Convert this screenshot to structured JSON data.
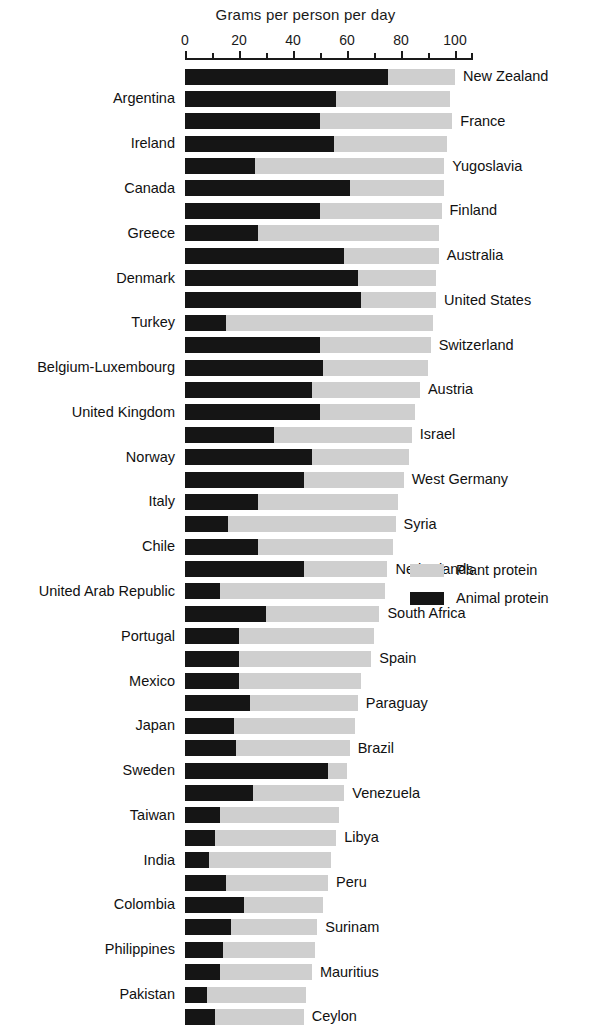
{
  "chart_data": {
    "type": "bar",
    "orientation": "horizontal",
    "stacked": true,
    "title": "Grams per person per day",
    "xlabel": "Grams per person per day",
    "ylabel": "",
    "xlim": [
      0,
      107
    ],
    "grid": false,
    "legend_position": "bottom-right",
    "tick_labels": [
      "0",
      "20",
      "40",
      "60",
      "80",
      "100"
    ],
    "tick_values": [
      0,
      20,
      40,
      60,
      80,
      100
    ],
    "minor_tick_values": [
      10,
      30,
      50,
      70,
      90
    ],
    "series": [
      {
        "name": "Animal protein",
        "color": "#151515"
      },
      {
        "name": "Plant protein",
        "color": "#cfcfcf"
      }
    ],
    "categories": [
      "New Zealand",
      "Argentina",
      "France",
      "Ireland",
      "Yugoslavia",
      "Canada",
      "Finland",
      "Greece",
      "Australia",
      "Denmark",
      "United States",
      "Turkey",
      "Switzerland",
      "Belgium-Luxembourg",
      "Austria",
      "United Kingdom",
      "Israel",
      "Norway",
      "West Germany",
      "Italy",
      "Syria",
      "Chile",
      "Netherlands",
      "United Arab Republic",
      "South Africa",
      "Portugal",
      "Spain",
      "Mexico",
      "Paraguay",
      "Japan",
      "Brazil",
      "Sweden",
      "Venezuela",
      "Taiwan",
      "Libya",
      "India",
      "Peru",
      "Colombia",
      "Surinam",
      "Philippines",
      "Mauritius",
      "Pakistan",
      "Ceylon"
    ],
    "rows": [
      {
        "label": "New Zealand",
        "side": "right",
        "animal": 75,
        "plant": 25,
        "total": 100
      },
      {
        "label": "Argentina",
        "side": "left",
        "animal": 56,
        "plant": 42,
        "total": 98
      },
      {
        "label": "France",
        "side": "right",
        "animal": 50,
        "plant": 49,
        "total": 99
      },
      {
        "label": "Ireland",
        "side": "left",
        "animal": 55,
        "plant": 42,
        "total": 97
      },
      {
        "label": "Yugoslavia",
        "side": "right",
        "animal": 26,
        "plant": 70,
        "total": 96
      },
      {
        "label": "Canada",
        "side": "left",
        "animal": 61,
        "plant": 35,
        "total": 96
      },
      {
        "label": "Finland",
        "side": "right",
        "animal": 50,
        "plant": 45,
        "total": 95
      },
      {
        "label": "Greece",
        "side": "left",
        "animal": 27,
        "plant": 67,
        "total": 94
      },
      {
        "label": "Australia",
        "side": "right",
        "animal": 59,
        "plant": 35,
        "total": 94
      },
      {
        "label": "Denmark",
        "side": "left",
        "animal": 64,
        "plant": 29,
        "total": 93
      },
      {
        "label": "United States",
        "side": "right",
        "animal": 65,
        "plant": 28,
        "total": 93
      },
      {
        "label": "Turkey",
        "side": "left",
        "animal": 15,
        "plant": 77,
        "total": 92
      },
      {
        "label": "Switzerland",
        "side": "right",
        "animal": 50,
        "plant": 41,
        "total": 91
      },
      {
        "label": "Belgium-Luxembourg",
        "side": "left",
        "animal": 51,
        "plant": 39,
        "total": 90
      },
      {
        "label": "Austria",
        "side": "right",
        "animal": 47,
        "plant": 40,
        "total": 87
      },
      {
        "label": "United Kingdom",
        "side": "left",
        "animal": 50,
        "plant": 35,
        "total": 85
      },
      {
        "label": "Israel",
        "side": "right",
        "animal": 33,
        "plant": 51,
        "total": 84
      },
      {
        "label": "Norway",
        "side": "left",
        "animal": 47,
        "plant": 36,
        "total": 83
      },
      {
        "label": "West Germany",
        "side": "right",
        "animal": 44,
        "plant": 37,
        "total": 81
      },
      {
        "label": "Italy",
        "side": "left",
        "animal": 27,
        "plant": 52,
        "total": 79
      },
      {
        "label": "Syria",
        "side": "right",
        "animal": 16,
        "plant": 62,
        "total": 78
      },
      {
        "label": "Chile",
        "side": "left",
        "animal": 27,
        "plant": 50,
        "total": 77
      },
      {
        "label": "Netherlands",
        "side": "right",
        "animal": 44,
        "plant": 31,
        "total": 75
      },
      {
        "label": "United Arab Republic",
        "side": "left",
        "animal": 13,
        "plant": 61,
        "total": 74
      },
      {
        "label": "South Africa",
        "side": "right",
        "animal": 30,
        "plant": 42,
        "total": 72
      },
      {
        "label": "Portugal",
        "side": "left",
        "animal": 20,
        "plant": 50,
        "total": 70
      },
      {
        "label": "Spain",
        "side": "right",
        "animal": 20,
        "plant": 49,
        "total": 69
      },
      {
        "label": "Mexico",
        "side": "left",
        "animal": 20,
        "plant": 45,
        "total": 65
      },
      {
        "label": "Paraguay",
        "side": "right",
        "animal": 24,
        "plant": 40,
        "total": 64
      },
      {
        "label": "Japan",
        "side": "left",
        "animal": 18,
        "plant": 45,
        "total": 63
      },
      {
        "label": "Brazil",
        "side": "right",
        "animal": 19,
        "plant": 42,
        "total": 61
      },
      {
        "label": "Sweden",
        "side": "left",
        "animal": 53,
        "plant": 7,
        "total": 60
      },
      {
        "label": "Venezuela",
        "side": "right",
        "animal": 25,
        "plant": 34,
        "total": 59
      },
      {
        "label": "Taiwan",
        "side": "left",
        "animal": 13,
        "plant": 44,
        "total": 57
      },
      {
        "label": "Libya",
        "side": "right",
        "animal": 11,
        "plant": 45,
        "total": 56
      },
      {
        "label": "India",
        "side": "left",
        "animal": 9,
        "plant": 45,
        "total": 54
      },
      {
        "label": "Peru",
        "side": "right",
        "animal": 15,
        "plant": 38,
        "total": 53
      },
      {
        "label": "Colombia",
        "side": "left",
        "animal": 22,
        "plant": 29,
        "total": 51
      },
      {
        "label": "Surinam",
        "side": "right",
        "animal": 17,
        "plant": 32,
        "total": 49
      },
      {
        "label": "Philippines",
        "side": "left",
        "animal": 14,
        "plant": 34,
        "total": 48
      },
      {
        "label": "Mauritius",
        "side": "right",
        "animal": 13,
        "plant": 34,
        "total": 47
      },
      {
        "label": "Pakistan",
        "side": "left",
        "animal": 8,
        "plant": 37,
        "total": 45
      },
      {
        "label": "Ceylon",
        "side": "right",
        "animal": 11,
        "plant": 33,
        "total": 44
      }
    ]
  },
  "legend": {
    "items": [
      {
        "label": "Plant protein",
        "color": "#cfcfcf",
        "swatch": "plant"
      },
      {
        "label": "Animal protein",
        "color": "#151515",
        "swatch": "animal"
      }
    ]
  }
}
